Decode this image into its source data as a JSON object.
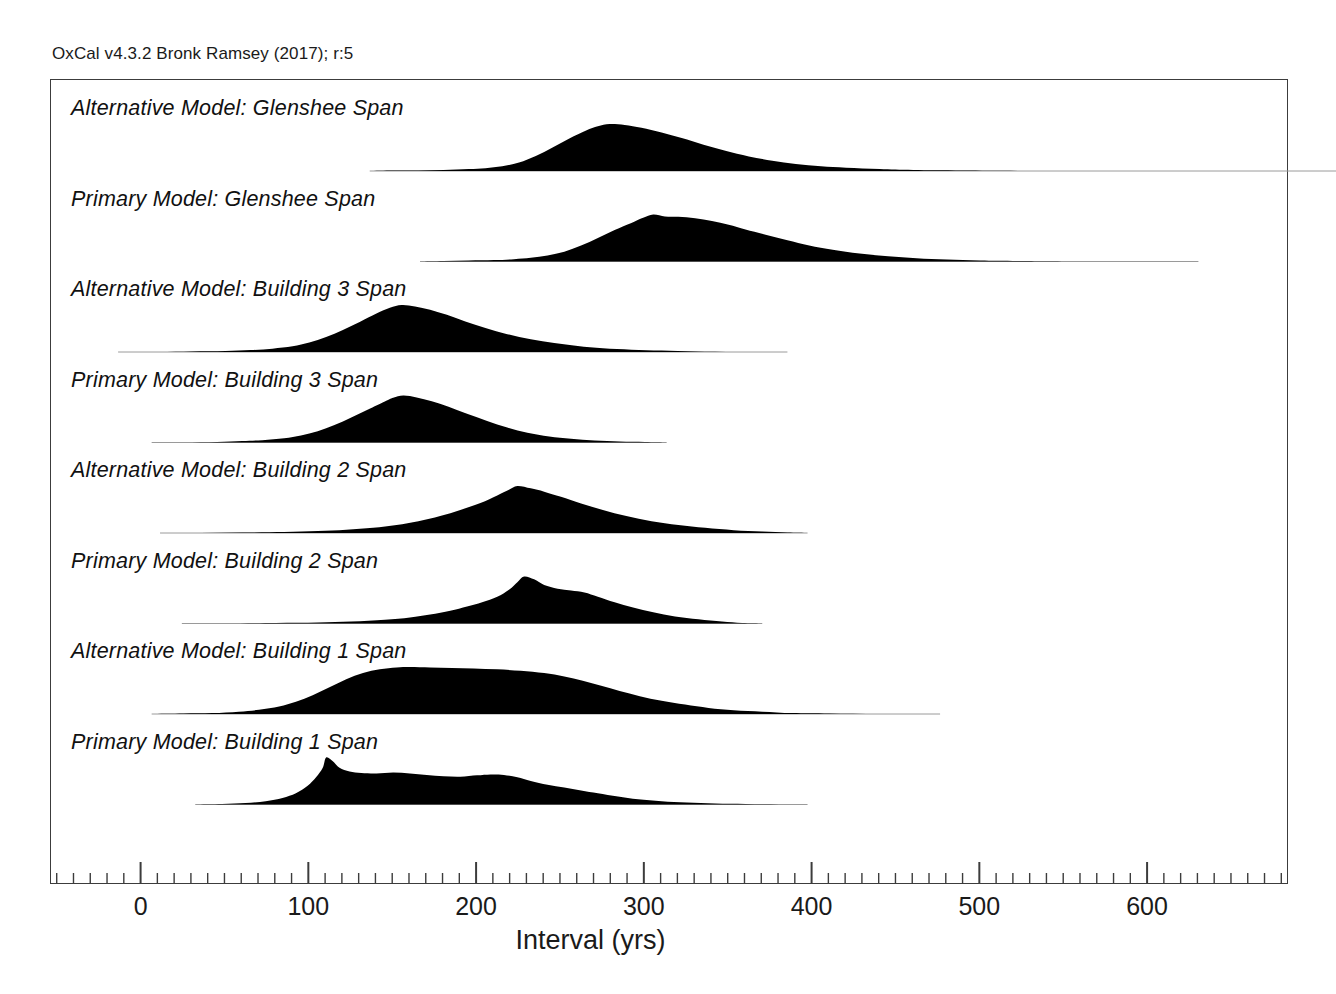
{
  "figure": {
    "credit": "OxCal v4.3.2 Bronk Ramsey (2017); r:5",
    "axis_title": "Interval (yrs)"
  },
  "chart_data": {
    "type": "area",
    "title": "",
    "subtitle": "",
    "xlabel": "Interval (yrs)",
    "ylabel": "",
    "xlim": [
      -54,
      684
    ],
    "xticks_major": [
      0,
      100,
      200,
      300,
      400,
      500,
      600
    ],
    "xtick_labels": [
      "0",
      "100",
      "200",
      "300",
      "400",
      "500",
      "600"
    ],
    "xtick_minor_step": 10,
    "grid": false,
    "legend": "none",
    "series": [
      {
        "name": "Alternative Model: Glenshee Span",
        "range": [
          136,
          739
        ],
        "peak": 279,
        "points": [
          [
            136,
            0.0
          ],
          [
            150,
            0.01
          ],
          [
            165,
            0.01
          ],
          [
            180,
            0.02
          ],
          [
            195,
            0.04
          ],
          [
            205,
            0.06
          ],
          [
            215,
            0.1
          ],
          [
            225,
            0.18
          ],
          [
            235,
            0.32
          ],
          [
            245,
            0.5
          ],
          [
            255,
            0.69
          ],
          [
            265,
            0.86
          ],
          [
            272,
            0.95
          ],
          [
            279,
            1.0
          ],
          [
            288,
            0.98
          ],
          [
            298,
            0.92
          ],
          [
            310,
            0.82
          ],
          [
            322,
            0.7
          ],
          [
            335,
            0.56
          ],
          [
            348,
            0.43
          ],
          [
            362,
            0.31
          ],
          [
            376,
            0.22
          ],
          [
            390,
            0.15
          ],
          [
            405,
            0.1
          ],
          [
            420,
            0.07
          ],
          [
            440,
            0.04
          ],
          [
            460,
            0.02
          ],
          [
            490,
            0.01
          ],
          [
            540,
            0.0
          ],
          [
            620,
            0.0
          ],
          [
            739,
            0.0
          ]
        ]
      },
      {
        "name": "Primary Model: Glenshee Span",
        "range": [
          166,
          630
        ],
        "peak": 305,
        "points": [
          [
            166,
            0.0
          ],
          [
            180,
            0.01
          ],
          [
            195,
            0.02
          ],
          [
            210,
            0.03
          ],
          [
            222,
            0.05
          ],
          [
            232,
            0.08
          ],
          [
            242,
            0.13
          ],
          [
            252,
            0.21
          ],
          [
            262,
            0.34
          ],
          [
            272,
            0.5
          ],
          [
            282,
            0.67
          ],
          [
            292,
            0.82
          ],
          [
            299,
            0.93
          ],
          [
            305,
            1.0
          ],
          [
            312,
            0.96
          ],
          [
            320,
            0.95
          ],
          [
            330,
            0.92
          ],
          [
            340,
            0.86
          ],
          [
            350,
            0.78
          ],
          [
            360,
            0.68
          ],
          [
            372,
            0.57
          ],
          [
            385,
            0.45
          ],
          [
            398,
            0.34
          ],
          [
            412,
            0.25
          ],
          [
            428,
            0.17
          ],
          [
            445,
            0.11
          ],
          [
            462,
            0.07
          ],
          [
            480,
            0.04
          ],
          [
            500,
            0.02
          ],
          [
            525,
            0.01
          ],
          [
            560,
            0.0
          ],
          [
            630,
            0.0
          ]
        ]
      },
      {
        "name": "Alternative Model: Building 3 Span",
        "range": [
          -14,
          385
        ],
        "peak": 155,
        "points": [
          [
            -14,
            0.0
          ],
          [
            10,
            0.0
          ],
          [
            30,
            0.01
          ],
          [
            50,
            0.02
          ],
          [
            65,
            0.04
          ],
          [
            78,
            0.07
          ],
          [
            90,
            0.12
          ],
          [
            100,
            0.2
          ],
          [
            110,
            0.32
          ],
          [
            120,
            0.47
          ],
          [
            130,
            0.64
          ],
          [
            140,
            0.82
          ],
          [
            148,
            0.94
          ],
          [
            155,
            1.0
          ],
          [
            163,
            0.97
          ],
          [
            172,
            0.9
          ],
          [
            182,
            0.79
          ],
          [
            193,
            0.65
          ],
          [
            205,
            0.51
          ],
          [
            218,
            0.38
          ],
          [
            232,
            0.27
          ],
          [
            246,
            0.19
          ],
          [
            260,
            0.13
          ],
          [
            275,
            0.08
          ],
          [
            292,
            0.05
          ],
          [
            310,
            0.03
          ],
          [
            330,
            0.01
          ],
          [
            355,
            0.0
          ],
          [
            385,
            0.0
          ]
        ]
      },
      {
        "name": "Primary Model: Building 3 Span",
        "range": [
          6,
          313
        ],
        "peak": 155,
        "points": [
          [
            6,
            0.0
          ],
          [
            25,
            0.0
          ],
          [
            45,
            0.01
          ],
          [
            60,
            0.03
          ],
          [
            72,
            0.05
          ],
          [
            85,
            0.09
          ],
          [
            95,
            0.15
          ],
          [
            105,
            0.24
          ],
          [
            115,
            0.37
          ],
          [
            125,
            0.53
          ],
          [
            135,
            0.7
          ],
          [
            145,
            0.87
          ],
          [
            150,
            0.95
          ],
          [
            156,
            1.0
          ],
          [
            164,
            0.96
          ],
          [
            173,
            0.88
          ],
          [
            183,
            0.76
          ],
          [
            194,
            0.61
          ],
          [
            206,
            0.46
          ],
          [
            218,
            0.32
          ],
          [
            230,
            0.21
          ],
          [
            243,
            0.13
          ],
          [
            256,
            0.08
          ],
          [
            270,
            0.04
          ],
          [
            285,
            0.02
          ],
          [
            300,
            0.01
          ],
          [
            313,
            0.0
          ]
        ]
      },
      {
        "name": "Alternative Model: Building 2 Span",
        "range": [
          11,
          397
        ],
        "peak": 224,
        "points": [
          [
            11,
            0.0
          ],
          [
            35,
            0.0
          ],
          [
            60,
            0.01
          ],
          [
            85,
            0.02
          ],
          [
            105,
            0.04
          ],
          [
            122,
            0.07
          ],
          [
            138,
            0.11
          ],
          [
            152,
            0.17
          ],
          [
            165,
            0.25
          ],
          [
            178,
            0.36
          ],
          [
            190,
            0.49
          ],
          [
            202,
            0.64
          ],
          [
            212,
            0.8
          ],
          [
            219,
            0.92
          ],
          [
            224,
            1.0
          ],
          [
            232,
            0.95
          ],
          [
            240,
            0.88
          ],
          [
            250,
            0.77
          ],
          [
            262,
            0.63
          ],
          [
            275,
            0.49
          ],
          [
            289,
            0.36
          ],
          [
            304,
            0.25
          ],
          [
            320,
            0.17
          ],
          [
            336,
            0.11
          ],
          [
            353,
            0.06
          ],
          [
            370,
            0.03
          ],
          [
            385,
            0.01
          ],
          [
            397,
            0.0
          ]
        ]
      },
      {
        "name": "Primary Model: Building 2 Span",
        "range": [
          24,
          370
        ],
        "peak": 228,
        "points": [
          [
            24,
            0.0
          ],
          [
            50,
            0.0
          ],
          [
            80,
            0.01
          ],
          [
            105,
            0.02
          ],
          [
            125,
            0.04
          ],
          [
            145,
            0.08
          ],
          [
            160,
            0.13
          ],
          [
            172,
            0.19
          ],
          [
            184,
            0.27
          ],
          [
            194,
            0.36
          ],
          [
            203,
            0.45
          ],
          [
            212,
            0.57
          ],
          [
            219,
            0.72
          ],
          [
            224,
            0.88
          ],
          [
            228,
            1.0
          ],
          [
            234,
            0.94
          ],
          [
            240,
            0.82
          ],
          [
            248,
            0.74
          ],
          [
            256,
            0.7
          ],
          [
            264,
            0.66
          ],
          [
            272,
            0.57
          ],
          [
            282,
            0.45
          ],
          [
            293,
            0.34
          ],
          [
            305,
            0.24
          ],
          [
            318,
            0.15
          ],
          [
            332,
            0.09
          ],
          [
            346,
            0.04
          ],
          [
            358,
            0.01
          ],
          [
            370,
            0.0
          ]
        ]
      },
      {
        "name": "Alternative Model: Building 1 Span",
        "range": [
          6,
          476
        ],
        "peak": 160,
        "points": [
          [
            6,
            0.0
          ],
          [
            25,
            0.01
          ],
          [
            42,
            0.02
          ],
          [
            58,
            0.05
          ],
          [
            70,
            0.09
          ],
          [
            82,
            0.16
          ],
          [
            92,
            0.26
          ],
          [
            102,
            0.4
          ],
          [
            112,
            0.57
          ],
          [
            122,
            0.74
          ],
          [
            132,
            0.87
          ],
          [
            142,
            0.95
          ],
          [
            152,
            0.99
          ],
          [
            160,
            1.0
          ],
          [
            172,
            0.99
          ],
          [
            185,
            0.98
          ],
          [
            198,
            0.97
          ],
          [
            212,
            0.95
          ],
          [
            226,
            0.92
          ],
          [
            240,
            0.87
          ],
          [
            252,
            0.8
          ],
          [
            263,
            0.71
          ],
          [
            274,
            0.6
          ],
          [
            285,
            0.49
          ],
          [
            297,
            0.38
          ],
          [
            310,
            0.28
          ],
          [
            324,
            0.2
          ],
          [
            338,
            0.13
          ],
          [
            353,
            0.08
          ],
          [
            370,
            0.05
          ],
          [
            388,
            0.02
          ],
          [
            410,
            0.01
          ],
          [
            440,
            0.0
          ],
          [
            476,
            0.0
          ]
        ]
      },
      {
        "name": "Primary Model: Building 1 Span",
        "range": [
          32,
          397
        ],
        "peak": 110,
        "points": [
          [
            32,
            0.0
          ],
          [
            48,
            0.01
          ],
          [
            62,
            0.03
          ],
          [
            74,
            0.07
          ],
          [
            84,
            0.14
          ],
          [
            92,
            0.24
          ],
          [
            99,
            0.4
          ],
          [
            104,
            0.58
          ],
          [
            108,
            0.78
          ],
          [
            110,
            1.0
          ],
          [
            114,
            0.92
          ],
          [
            118,
            0.78
          ],
          [
            124,
            0.7
          ],
          [
            131,
            0.67
          ],
          [
            140,
            0.66
          ],
          [
            150,
            0.68
          ],
          [
            160,
            0.66
          ],
          [
            170,
            0.63
          ],
          [
            180,
            0.6
          ],
          [
            190,
            0.59
          ],
          [
            200,
            0.62
          ],
          [
            208,
            0.64
          ],
          [
            216,
            0.63
          ],
          [
            224,
            0.58
          ],
          [
            232,
            0.5
          ],
          [
            242,
            0.42
          ],
          [
            252,
            0.36
          ],
          [
            262,
            0.3
          ],
          [
            272,
            0.24
          ],
          [
            284,
            0.17
          ],
          [
            296,
            0.11
          ],
          [
            310,
            0.07
          ],
          [
            325,
            0.04
          ],
          [
            342,
            0.02
          ],
          [
            360,
            0.01
          ],
          [
            380,
            0.0
          ],
          [
            397,
            0.0
          ]
        ]
      }
    ]
  }
}
